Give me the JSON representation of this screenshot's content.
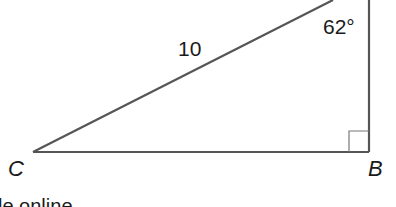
{
  "figure": {
    "type": "right-triangle",
    "vertices": {
      "C": "C",
      "B": "B"
    },
    "hypotenuse_label": "10",
    "angle_label": "62°",
    "right_angle_at": "B",
    "caption_fragment": "le online"
  },
  "colors": {
    "stroke": "#555555",
    "text": "#1a1a1a",
    "background": "#ffffff"
  }
}
